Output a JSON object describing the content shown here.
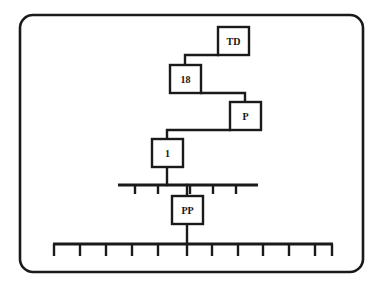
{
  "figure": {
    "frame": {
      "name": "rounded-border-frame",
      "x": 20,
      "y": 15,
      "width": 343,
      "height": 257,
      "radius": 13,
      "stroke": "#1a1a1a",
      "stroke_width": 2.6,
      "fill": "#ffffff"
    },
    "colors": {
      "line": "#1a1a1a",
      "box_fill": "#ffffff",
      "box_stroke": "#1a1a1a",
      "text": "#141414",
      "background": "#ffffff"
    },
    "nodes": [
      {
        "id": "td",
        "label": "TD",
        "x": 218,
        "y": 27,
        "width": 31,
        "height": 28
      },
      {
        "id": "eighteen",
        "label": "18",
        "x": 170,
        "y": 65,
        "width": 31,
        "height": 28
      },
      {
        "id": "p",
        "label": "P",
        "x": 230,
        "y": 102,
        "width": 31,
        "height": 28
      },
      {
        "id": "one",
        "label": "1",
        "x": 152,
        "y": 139,
        "width": 31,
        "height": 28
      },
      {
        "id": "pp",
        "label": "PP",
        "x": 172,
        "y": 196,
        "width": 31,
        "height": 28
      }
    ],
    "connectors": [
      {
        "id": "td-to-18",
        "from": "td",
        "to": "eighteen",
        "points": "218,55 185,55 185,65"
      },
      {
        "id": "18-to-p",
        "from": "eighteen",
        "to": "p",
        "points": "201,93 245,93 245,102"
      },
      {
        "id": "p-to-1",
        "from": "p",
        "to": "one",
        "points": "230,130 167,130 167,139"
      },
      {
        "id": "1-to-ruler-upper",
        "from": "one",
        "to": "ruler-upper",
        "points": "167,167 167,185"
      },
      {
        "id": "ruler-upper-to-pp",
        "from": "ruler-upper",
        "to": "pp",
        "points": "187,185 187,196"
      },
      {
        "id": "pp-to-ruler-lower",
        "from": "pp",
        "to": "ruler-lower",
        "points": "187,224 187,244"
      }
    ],
    "rulers": [
      {
        "id": "ruler-upper",
        "name": "upper-scale-bar",
        "x_start": 118,
        "x_end": 258,
        "y": 185,
        "tick_length": 9,
        "tick_positions": [
          135,
          158,
          190,
          213,
          236
        ],
        "tick_count": 5
      },
      {
        "id": "ruler-lower",
        "name": "lower-scale-bar",
        "x_start": 53,
        "x_end": 333,
        "y": 244,
        "tick_length": 12,
        "tick_positions": [
          54,
          80,
          106,
          132,
          158,
          187,
          212,
          238,
          263,
          289,
          315,
          332
        ],
        "tick_count": 12
      }
    ]
  }
}
